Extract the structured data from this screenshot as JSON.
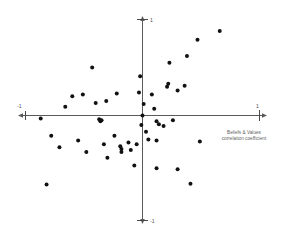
{
  "chart_data": {
    "type": "scatter",
    "title": "",
    "subtitle": "",
    "xlabel": "Beliefs & Values correlation coefficient",
    "ylabel": "",
    "xlim": [
      -1,
      1
    ],
    "ylim": [
      -1,
      1
    ],
    "grid": false,
    "legend": null,
    "axis_style": "four-way arrowed axes crossing at origin",
    "x_tick_labels": [
      "-1",
      "1"
    ],
    "y_tick_labels": [
      "-1",
      "1"
    ],
    "x_ticks": [
      -1,
      1
    ],
    "y_ticks": [
      -1,
      1
    ],
    "point_count": 52,
    "marker": {
      "shape": "circle",
      "color": "#111111",
      "size_px": 4
    },
    "points": [
      {
        "x": -0.66,
        "y": 0.09
      },
      {
        "x": -0.87,
        "y": -0.03
      },
      {
        "x": -0.6,
        "y": 0.2
      },
      {
        "x": -0.51,
        "y": 0.22
      },
      {
        "x": -0.43,
        "y": 0.5
      },
      {
        "x": -0.4,
        "y": 0.13
      },
      {
        "x": -0.31,
        "y": 0.15
      },
      {
        "x": -0.22,
        "y": 0.23
      },
      {
        "x": -0.37,
        "y": -0.04
      },
      {
        "x": -0.36,
        "y": -0.06
      },
      {
        "x": -0.35,
        "y": -0.05
      },
      {
        "x": -0.78,
        "y": -0.21
      },
      {
        "x": -0.71,
        "y": -0.33
      },
      {
        "x": -0.55,
        "y": -0.26
      },
      {
        "x": -0.48,
        "y": -0.38
      },
      {
        "x": -0.33,
        "y": -0.3
      },
      {
        "x": -0.3,
        "y": -0.44
      },
      {
        "x": -0.24,
        "y": -0.21
      },
      {
        "x": -0.19,
        "y": -0.32
      },
      {
        "x": -0.18,
        "y": -0.35
      },
      {
        "x": -0.18,
        "y": -0.38
      },
      {
        "x": -0.12,
        "y": -0.28
      },
      {
        "x": -0.1,
        "y": -0.36
      },
      {
        "x": -0.07,
        "y": -0.52
      },
      {
        "x": -0.82,
        "y": -0.72
      },
      {
        "x": -0.03,
        "y": 0.24
      },
      {
        "x": -0.02,
        "y": 0.41
      },
      {
        "x": -0.01,
        "y": -0.1
      },
      {
        "x": 0.0,
        "y": 0.0
      },
      {
        "x": 0.01,
        "y": 0.12
      },
      {
        "x": 0.03,
        "y": -0.17
      },
      {
        "x": 0.08,
        "y": 0.22
      },
      {
        "x": 0.1,
        "y": 0.07
      },
      {
        "x": 0.12,
        "y": -0.06
      },
      {
        "x": 0.14,
        "y": -0.09
      },
      {
        "x": 0.12,
        "y": -0.26
      },
      {
        "x": 0.05,
        "y": -0.25
      },
      {
        "x": 0.21,
        "y": 0.3
      },
      {
        "x": 0.22,
        "y": 0.33
      },
      {
        "x": 0.23,
        "y": 0.55
      },
      {
        "x": 0.26,
        "y": -0.05
      },
      {
        "x": 0.3,
        "y": 0.26
      },
      {
        "x": 0.36,
        "y": 0.31
      },
      {
        "x": 0.38,
        "y": 0.62
      },
      {
        "x": 0.47,
        "y": 0.79
      },
      {
        "x": 0.66,
        "y": 0.88
      },
      {
        "x": 0.49,
        "y": -0.27
      },
      {
        "x": 0.3,
        "y": -0.56
      },
      {
        "x": 0.12,
        "y": -0.55
      },
      {
        "x": 0.41,
        "y": -0.71
      },
      {
        "x": -0.05,
        "y": -0.3
      },
      {
        "x": 0.18,
        "y": -0.11
      }
    ]
  },
  "axis_labels": {
    "x_right": "1",
    "x_left": "-1",
    "y_top": "1",
    "y_bottom": "-1"
  },
  "caption": {
    "line1": "Beliefs & Values",
    "line2": "correlation coefficient"
  },
  "colors": {
    "background": "#ffffff",
    "axis": "#5a5a5a",
    "dot": "#111111",
    "text": "#606060"
  }
}
